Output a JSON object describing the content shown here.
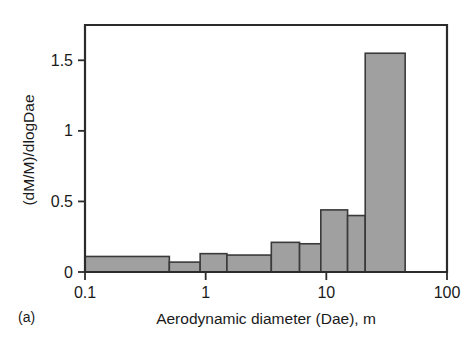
{
  "panel": {
    "label": "(a)"
  },
  "chart_data": {
    "type": "bar",
    "title": "",
    "subtitle": "",
    "xlabel": "Aerodynamic diameter (Dae), m",
    "ylabel": "(dM/M)/dlogDae",
    "xscale": "log",
    "yscale": "linear",
    "xlim": [
      0.1,
      100
    ],
    "ylim": [
      0,
      1.75
    ],
    "grid": false,
    "legend": false,
    "legend_position": "none",
    "xticks": [
      0.1,
      1,
      10,
      100
    ],
    "xtick_labels": [
      "0.1",
      "1",
      "10",
      "100"
    ],
    "yticks": [
      0,
      0.5,
      1,
      1.5
    ],
    "ytick_labels": [
      "0",
      "0.5",
      "1",
      "1.5"
    ],
    "bar_fill_color": "#a0a0a0",
    "bar_edge_color": "#3a3a3a",
    "axis_color": "#2b2b2b",
    "bin_edges": [
      0.1,
      0.5,
      0.9,
      1.5,
      3.5,
      6.0,
      9.0,
      15.0,
      21.0,
      45.0
    ],
    "values": [
      0.11,
      0.07,
      0.13,
      0.12,
      0.21,
      0.2,
      0.44,
      0.4,
      1.55
    ],
    "bins": [
      {
        "x_low": 0.1,
        "x_high": 0.5,
        "value": 0.11
      },
      {
        "x_low": 0.5,
        "x_high": 0.9,
        "value": 0.07
      },
      {
        "x_low": 0.9,
        "x_high": 1.5,
        "value": 0.13
      },
      {
        "x_low": 1.5,
        "x_high": 3.5,
        "value": 0.12
      },
      {
        "x_low": 3.5,
        "x_high": 6.0,
        "value": 0.21
      },
      {
        "x_low": 6.0,
        "x_high": 9.0,
        "value": 0.2
      },
      {
        "x_low": 9.0,
        "x_high": 15.0,
        "value": 0.44
      },
      {
        "x_low": 15.0,
        "x_high": 21.0,
        "value": 0.4
      },
      {
        "x_low": 21.0,
        "x_high": 45.0,
        "value": 1.55
      }
    ]
  }
}
